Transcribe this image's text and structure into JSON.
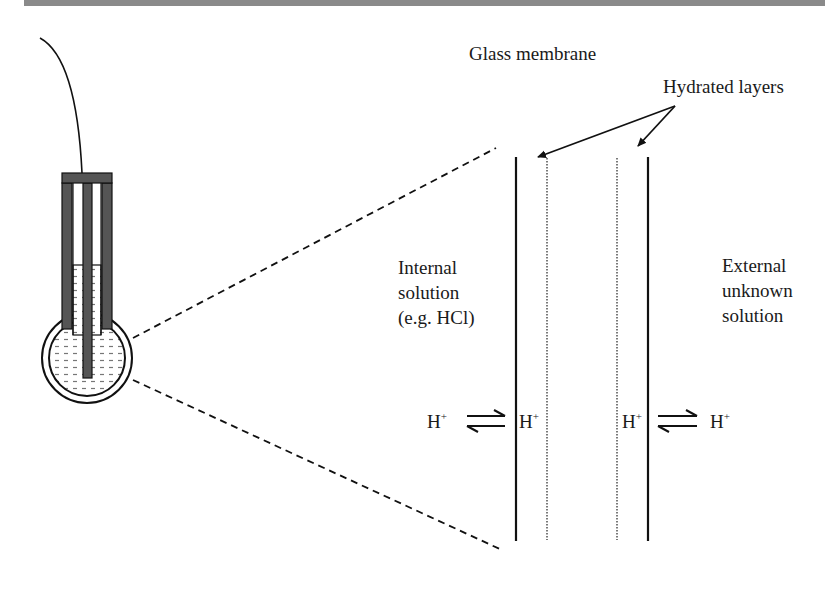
{
  "figure": {
    "labels": {
      "glass_membrane": "Glass membrane",
      "hydrated_layers": "Hydrated layers",
      "internal_solution": [
        "Internal",
        "solution",
        "(e.g. HCl)"
      ],
      "external_solution": [
        "External",
        "unknown",
        "solution"
      ],
      "ion": "H",
      "ion_charge": "+"
    },
    "equilibria": [
      {
        "left": "H+",
        "right": "H+",
        "side": "internal"
      },
      {
        "left": "H+",
        "right": "H+",
        "side": "external"
      }
    ],
    "components": {
      "electrode": "glass electrode with wire, cap, outer tubes, internal reference rod and bulb filled with solution",
      "zoom_lines": "dashed lines magnifying bulb to membrane cross-section",
      "membrane": {
        "outer_walls": "solid lines",
        "hydrated_layers": "dotted lines"
      }
    },
    "colors": {
      "ink": "#111111",
      "tube_fill": "#555555",
      "top_bar": "#8a8a8a",
      "liquid_dash": "#777777"
    }
  }
}
